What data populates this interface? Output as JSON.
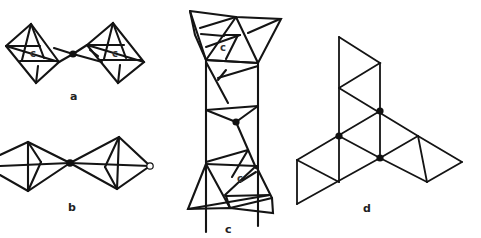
{
  "figure": {
    "panels": [
      {
        "id": "a",
        "label": "a",
        "description": "two octahedra sharing a corner atom",
        "inner_labels": [
          "c",
          "c"
        ]
      },
      {
        "id": "b",
        "label": "b",
        "description": "two trigonal bipyramids sharing a corner, open circle at right apex",
        "inner_labels": []
      },
      {
        "id": "c",
        "label": "c",
        "description": "vertical chain of polyhedra with shared central atom",
        "inner_labels": [
          "c",
          "c"
        ]
      },
      {
        "id": "d",
        "label": "d",
        "description": "triangular net with three filled nodes",
        "inner_labels": []
      }
    ],
    "colors": {
      "line": "#141414",
      "background": "#ffffff"
    }
  }
}
